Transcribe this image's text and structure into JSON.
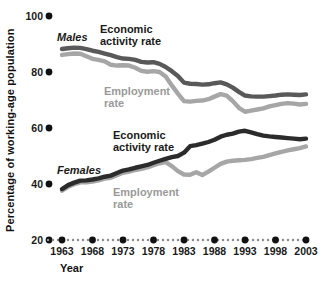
{
  "chart_data": {
    "type": "line",
    "title": "",
    "xlabel": "Year",
    "ylabel": "Percentage of working-age population",
    "xlim": [
      1963,
      2003
    ],
    "ylim": [
      20,
      100
    ],
    "ytick_labels": [
      "100",
      "80",
      "60",
      "40",
      "20"
    ],
    "ytick_values": [
      100,
      80,
      60,
      40,
      20
    ],
    "xtick_labels": [
      "1963",
      "1968",
      "1973",
      "1978",
      "1983",
      "1988",
      "1993",
      "1998",
      "2003"
    ],
    "xtick_values": [
      1963,
      1968,
      1973,
      1978,
      1983,
      1988,
      1993,
      1998,
      2003
    ],
    "grid": false,
    "legend_position": "inline-annotations",
    "x": [
      1963,
      1964,
      1965,
      1966,
      1967,
      1968,
      1969,
      1970,
      1971,
      1972,
      1973,
      1974,
      1975,
      1976,
      1977,
      1978,
      1979,
      1980,
      1981,
      1982,
      1983,
      1984,
      1985,
      1986,
      1987,
      1988,
      1989,
      1990,
      1991,
      1992,
      1993,
      1994,
      1995,
      1996,
      1997,
      1998,
      1999,
      2000,
      2001,
      2002,
      2003
    ],
    "series": [
      {
        "name": "Males Economic activity rate",
        "group": "Males",
        "measure": "Economic activity rate",
        "color": "#595959",
        "values": [
          88.2,
          88.5,
          88.7,
          88.6,
          88.2,
          87.6,
          87.2,
          86.6,
          86.0,
          85.3,
          84.8,
          84.7,
          84.3,
          83.6,
          83.4,
          83.5,
          82.9,
          81.8,
          80.3,
          78.6,
          76.2,
          75.8,
          75.7,
          75.5,
          75.6,
          76.0,
          76.3,
          75.6,
          74.4,
          72.9,
          71.6,
          71.3,
          71.2,
          71.2,
          71.4,
          71.6,
          71.9,
          72.0,
          71.9,
          71.8,
          72.0
        ]
      },
      {
        "name": "Males Employment rate",
        "group": "Males",
        "measure": "Employment rate",
        "color": "#a6a6a6",
        "values": [
          86.1,
          86.4,
          86.6,
          86.5,
          85.6,
          84.7,
          84.3,
          83.8,
          82.6,
          82.3,
          82.4,
          82.3,
          81.5,
          80.4,
          80.1,
          80.3,
          80.0,
          78.4,
          75.2,
          72.3,
          69.6,
          69.4,
          69.7,
          69.8,
          70.3,
          71.2,
          72.1,
          71.6,
          69.6,
          67.2,
          65.8,
          66.2,
          66.6,
          67.0,
          67.7,
          68.2,
          68.6,
          68.9,
          68.7,
          68.4,
          68.6
        ]
      },
      {
        "name": "Females Economic activity rate",
        "group": "Females",
        "measure": "Economic activity rate",
        "color": "#2b2b2b",
        "values": [
          38.2,
          39.6,
          40.5,
          41.2,
          41.3,
          41.6,
          42.0,
          42.6,
          43.0,
          43.9,
          44.8,
          45.2,
          45.8,
          46.3,
          46.8,
          47.6,
          48.3,
          49.0,
          49.6,
          50.0,
          51.2,
          53.5,
          53.9,
          54.4,
          55.0,
          55.8,
          56.9,
          57.6,
          58.0,
          58.7,
          59.0,
          58.4,
          57.8,
          57.3,
          57.0,
          56.8,
          56.6,
          56.4,
          56.2,
          56.0,
          56.2
        ]
      },
      {
        "name": "Females Employment rate",
        "group": "Females",
        "measure": "Employment rate",
        "color": "#a6a6a6",
        "values": [
          37.6,
          39.0,
          39.9,
          40.6,
          40.6,
          40.9,
          41.3,
          41.9,
          42.2,
          43.1,
          44.0,
          44.4,
          45.0,
          45.4,
          45.9,
          46.7,
          47.4,
          47.8,
          46.4,
          44.6,
          43.4,
          43.3,
          44.2,
          43.2,
          44.4,
          45.8,
          47.2,
          48.0,
          48.3,
          48.5,
          48.6,
          48.9,
          49.3,
          49.7,
          50.3,
          50.9,
          51.5,
          52.0,
          52.4,
          52.8,
          53.4
        ]
      }
    ],
    "annotations": [
      {
        "id": "males-label",
        "text": "Males",
        "style": "italic-dark"
      },
      {
        "id": "males-econ-label",
        "text": "Economic\nactivity rate",
        "line1": "Economic",
        "line2": "activity rate",
        "style": "dark"
      },
      {
        "id": "males-emp-label",
        "text": "Employment\nrate",
        "line1": "Employment",
        "line2": "rate",
        "style": "gray"
      },
      {
        "id": "females-label",
        "text": "Females",
        "style": "italic-dark"
      },
      {
        "id": "females-econ-label",
        "text": "Economic\nactivity rate",
        "line1": "Economic",
        "line2": "activity rate",
        "style": "dark"
      },
      {
        "id": "females-emp-label",
        "text": "Employment\nrate",
        "line1": "Employment",
        "line2": "rate",
        "style": "gray"
      }
    ],
    "colors": {
      "males_econ": "#595959",
      "males_emp": "#a6a6a6",
      "females_econ": "#2b2b2b",
      "females_emp": "#a6a6a6",
      "axis": "#111111",
      "background": "#ffffff"
    }
  }
}
